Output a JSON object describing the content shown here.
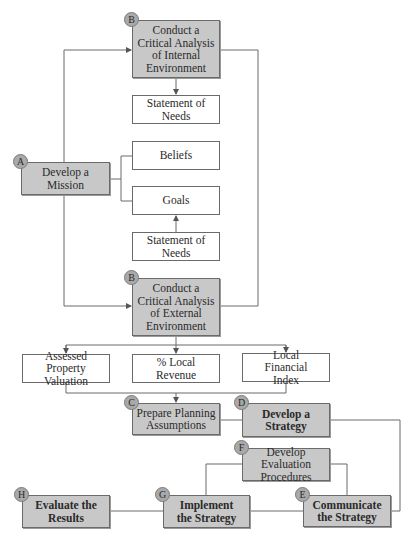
{
  "diagram": {
    "nodes": {
      "develop_mission": {
        "badge": "A",
        "label": "Develop a Mission"
      },
      "internal_analysis": {
        "badge": "B",
        "label": "Conduct a Critical Analysis of Internal Environment"
      },
      "needs_top": {
        "label": "Statement of Needs"
      },
      "beliefs": {
        "label": "Beliefs"
      },
      "goals": {
        "label": "Goals"
      },
      "needs_bottom": {
        "label": "Statement of Needs"
      },
      "external_analysis": {
        "badge": "B",
        "label": "Conduct a Critical Analysis of External Environment"
      },
      "assessed_property": {
        "label": "Assessed Property Valuation"
      },
      "local_revenue": {
        "label": "% Local Revenue"
      },
      "local_financial_index": {
        "label": "Local Financial Index"
      },
      "planning_assumptions": {
        "badge": "C",
        "label": "Prepare Planning Assumptions"
      },
      "develop_strategy": {
        "badge": "D",
        "label": "Develop a Strategy"
      },
      "evaluation_procedures": {
        "badge": "F",
        "label": "Develop Evaluation Procedures"
      },
      "communicate_strategy": {
        "badge": "E",
        "label": "Communicate the Strategy"
      },
      "implement_strategy": {
        "badge": "G",
        "label": "Implement the Strategy"
      },
      "evaluate_results": {
        "badge": "H",
        "label": "Evaluate the Results"
      }
    },
    "colors": {
      "process_fill": "#c8c8c8",
      "data_fill": "#ffffff",
      "badge_fill": "#a9a9a9",
      "line": "#6a6a6a"
    }
  }
}
